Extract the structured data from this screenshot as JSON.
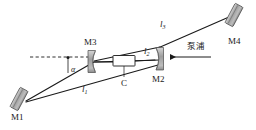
{
  "figure": {
    "type": "optical-cavity-diagram",
    "background_color": "#ffffff",
    "line_color": "#1a1a1a",
    "mirror_fill": "#a8a8a8",
    "crystal_fill": "#ffffff",
    "width": 256,
    "height": 130
  },
  "labels": {
    "m1": "M1",
    "m2": "M2",
    "m3": "M3",
    "m4": "M4",
    "crystal": "C",
    "arm1": "l",
    "arm1_sub": "1",
    "arm2": "l",
    "arm2_sub": "2",
    "arm3": "l",
    "arm3_sub": "3",
    "angle": "α",
    "pump": "泵浦"
  },
  "components": [
    {
      "name": "M1",
      "kind": "flat-mirror",
      "label": "M1"
    },
    {
      "name": "M2",
      "kind": "concave-mirror",
      "label": "M2"
    },
    {
      "name": "M3",
      "kind": "concave-mirror",
      "label": "M3"
    },
    {
      "name": "M4",
      "kind": "flat-mirror",
      "label": "M4"
    },
    {
      "name": "C",
      "kind": "gain-crystal",
      "label": "C"
    }
  ],
  "arms": [
    {
      "name": "l1",
      "from": "M1",
      "to": "M3",
      "label": "l1"
    },
    {
      "name": "l2",
      "from": "M3",
      "to": "M2",
      "label": "l2"
    },
    {
      "name": "l3",
      "from": "M2",
      "to": "M4",
      "label": "l3"
    }
  ],
  "annotations": {
    "angle_between": "dashed-reference-axis and l1",
    "pump_direction": "right-to-left into M2"
  }
}
